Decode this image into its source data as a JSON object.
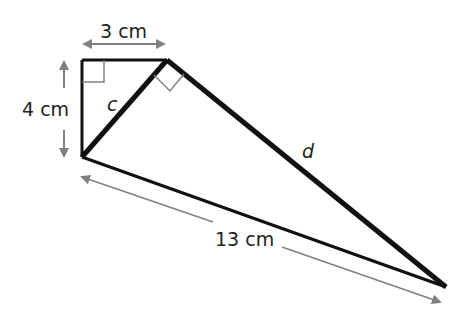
{
  "diagram": {
    "type": "geometry-right-triangles",
    "labels": {
      "top_side": "3 cm",
      "left_side": "4 cm",
      "bottom_side": "13 cm",
      "hypotenuse_small": "c",
      "long_side": "d"
    },
    "colors": {
      "line": "#111111",
      "arrow": "#808080",
      "right_angle_marker": "#808080"
    }
  }
}
